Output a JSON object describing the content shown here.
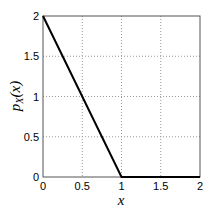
{
  "chart_data": {
    "type": "line",
    "title": "",
    "xlabel": "x",
    "ylabel": "p_X(x)",
    "xlim": [
      0,
      2
    ],
    "ylim": [
      0,
      2
    ],
    "grid": true,
    "xticks": [
      "0",
      "0.5",
      "1",
      "1.5",
      "2"
    ],
    "yticks": [
      "0",
      "0.5",
      "1",
      "1.5",
      "2"
    ],
    "series": [
      {
        "name": "p_X(x)",
        "x": [
          0,
          1,
          2
        ],
        "y": [
          2,
          0,
          0
        ],
        "color": "#000000"
      }
    ]
  },
  "labels": {
    "xlabel": "x",
    "ylabel_main": "p",
    "ylabel_sub": "X",
    "ylabel_arg": "(x)"
  }
}
